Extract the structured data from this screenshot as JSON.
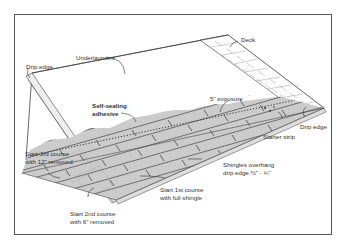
{
  "diagram": {
    "labels": {
      "deck": "Deck",
      "underlayment": "Underlayment",
      "drip_edge_left": "Drip edge",
      "drip_edge_right": "Drip edge",
      "self_sealing_1": "Self-sealing",
      "self_sealing_2": "adhesive",
      "exposure": "5\" exposure",
      "starter_strip": "Starter strip",
      "overhang_1": "Shingles overhang",
      "overhang_2": "drip edge ½\" - ¾\"",
      "third_course_1": "Start 3rd course",
      "third_course_2": "with 12\" removed",
      "second_course_1": "Start 2nd course",
      "second_course_2": "with 6\" removed",
      "first_course_1": "Start 1st course",
      "first_course_2": "with full shingle"
    },
    "colors": {
      "line": "#444444",
      "shingle": "#c8c8c8",
      "shingle_dark": "#8a8a8a",
      "deck": "#ffffff"
    }
  }
}
